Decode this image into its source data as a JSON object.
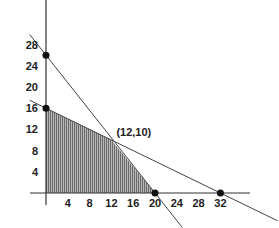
{
  "chart_data": {
    "type": "line",
    "title": "",
    "xlabel": "",
    "ylabel": "",
    "xlim": [
      -3,
      36
    ],
    "ylim": [
      -2,
      36
    ],
    "grid": false,
    "x_ticks": [
      4,
      8,
      12,
      16,
      20,
      24,
      28,
      32
    ],
    "y_ticks": [
      4,
      8,
      12,
      16,
      20,
      24,
      28
    ],
    "series": [
      {
        "name": "constraint-line-1",
        "points": [
          [
            0,
            16
          ],
          [
            12,
            10
          ],
          [
            32,
            0
          ]
        ],
        "equation": "x + 2y = 32"
      },
      {
        "name": "constraint-line-2",
        "points": [
          [
            0,
            26
          ],
          [
            12,
            10
          ],
          [
            20,
            0
          ]
        ],
        "equation": "4x + 3y = 80 (approx.)"
      }
    ],
    "feasible_region": {
      "vertices": [
        [
          0,
          0
        ],
        [
          0,
          16
        ],
        [
          12,
          10
        ],
        [
          20,
          0
        ]
      ],
      "fill": "vertical hatching"
    },
    "marked_points": [
      [
        0,
        26
      ],
      [
        0,
        16
      ],
      [
        20,
        0
      ],
      [
        32,
        0
      ]
    ],
    "annotations": [
      {
        "text": "(12,10)",
        "x": 12,
        "y": 10
      }
    ]
  },
  "colors": {
    "axis": "#333333",
    "line": "#444444",
    "fill": "#8a8a8a",
    "point": "#111111"
  }
}
